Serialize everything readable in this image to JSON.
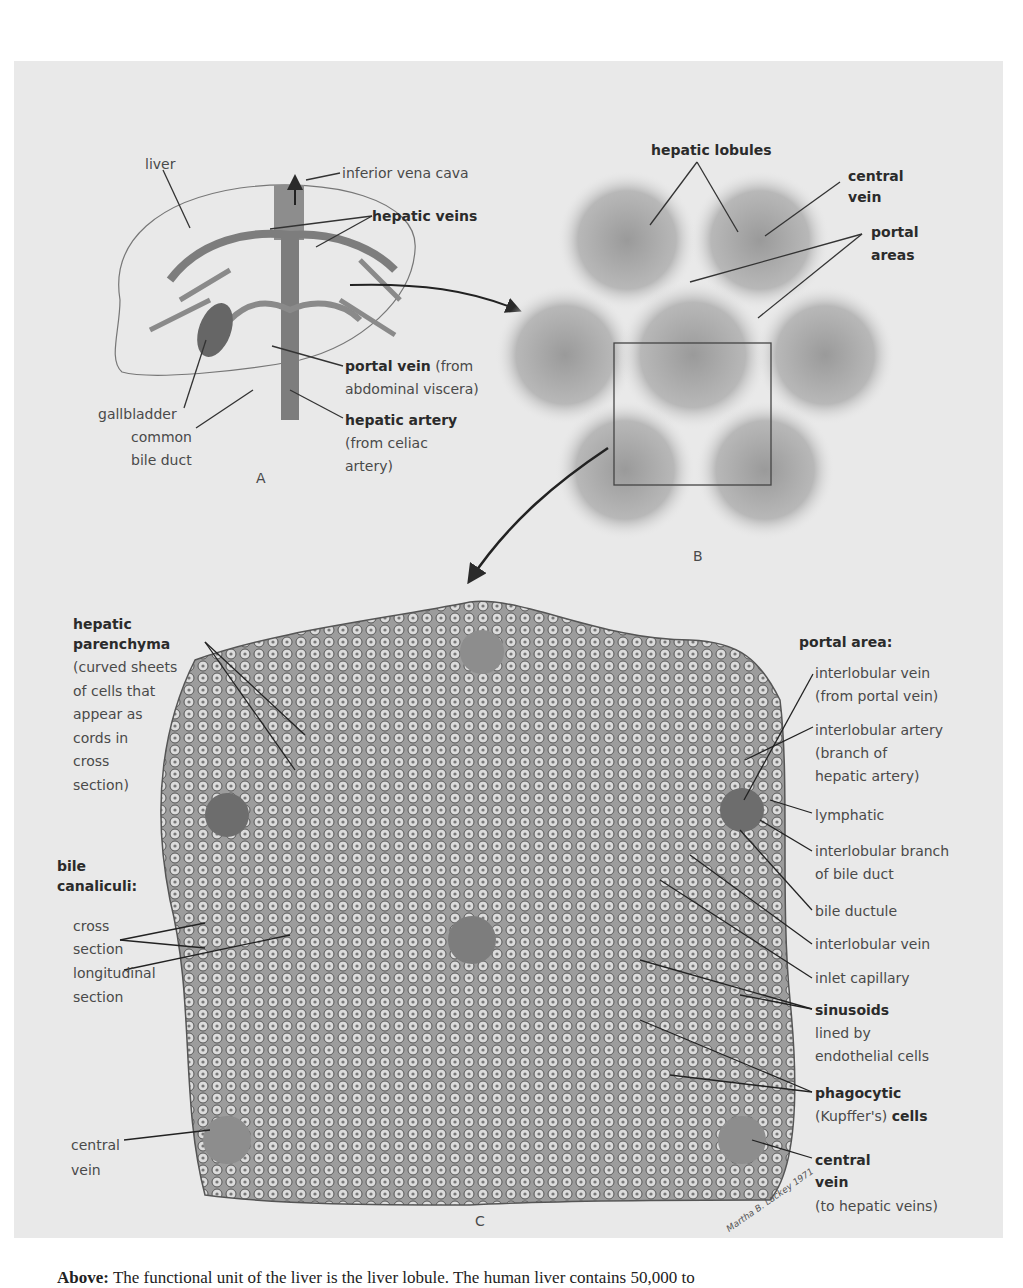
{
  "figure_a": {
    "letter": "A",
    "labels": {
      "liver": "liver",
      "inferior_vena_cava": "inferior vena cava",
      "hepatic_veins": "hepatic veins",
      "portal_vein": "portal vein",
      "portal_vein_note": " (from",
      "portal_vein_note2": "abdominal viscera)",
      "gallbladder": "gallbladder",
      "common_bile_duct_1": "common",
      "common_bile_duct_2": "bile duct",
      "hepatic_artery": "hepatic artery",
      "hepatic_artery_note1": "(from celiac",
      "hepatic_artery_note2": "artery)"
    }
  },
  "figure_b": {
    "letter": "B",
    "labels": {
      "hepatic_lobules": "hepatic lobules",
      "central_vein_1": "central",
      "central_vein_2": "vein",
      "portal_areas_1": "portal",
      "portal_areas_2": "areas"
    }
  },
  "figure_c": {
    "letter": "C",
    "left_labels": {
      "parenchyma_title1": "hepatic",
      "parenchyma_title2": "parenchyma",
      "parenchyma_desc": [
        "(curved sheets",
        "of cells that",
        "appear as",
        "cords in",
        "cross",
        "section)"
      ],
      "bile_title1": "bile",
      "bile_title2": "canaliculi:",
      "cross_1": "cross",
      "cross_2": "section",
      "long_1": "longitudinal",
      "long_2": "section",
      "central_vein_1": "central",
      "central_vein_2": "vein"
    },
    "right_labels": {
      "portal_area": "portal area:",
      "interlobular_vein_1": "interlobular vein",
      "interlobular_vein_2": "(from portal vein)",
      "interlobular_artery_1": "interlobular artery",
      "interlobular_artery_2": "(branch of",
      "interlobular_artery_3": "hepatic artery)",
      "lymphatic": "lymphatic",
      "bile_branch_1": "interlobular branch",
      "bile_branch_2": "of bile duct",
      "bile_ductule": "bile ductule",
      "interlobular_vein_b": "interlobular vein",
      "inlet_capillary": "inlet capillary",
      "sinusoids": "sinusoids",
      "sinusoids_desc1": "lined by",
      "sinusoids_desc2": "endothelial cells",
      "phagocytic": "phagocytic",
      "kupffer": "(Kupffer's) ",
      "kupffer_cells": "cells",
      "central_vein_1": "central",
      "central_vein_2": "vein",
      "central_vein_3": "(to hepatic veins)"
    },
    "signature": "Martha B. Lackey 1971"
  },
  "caption": {
    "lead": "Above:",
    "text": " The functional unit of the liver is the liver lobule. The human liver contains 50,000 to"
  },
  "colors": {
    "plate": "#e9e9e9",
    "ink": "#3a3a3a",
    "tissue": "#9a9a9a"
  }
}
